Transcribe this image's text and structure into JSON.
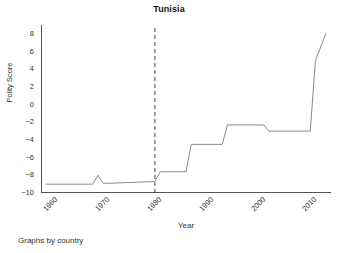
{
  "chart_data": {
    "type": "line",
    "title": "Tunisia",
    "xlabel": "Year",
    "ylabel": "Polity Score",
    "footnote": "Graphs by country",
    "xlim": [
      1958,
      2014
    ],
    "ylim": [
      -10,
      9
    ],
    "grid": false,
    "legend": null,
    "y_ticks": [
      8,
      6,
      4,
      2,
      0,
      -2,
      -4,
      -6,
      -8,
      -10
    ],
    "y_tick_labels": [
      "8",
      "6",
      "4",
      "2",
      "0",
      "−2",
      "−4",
      "−6",
      "−8",
      "−10"
    ],
    "x_ticks": [
      1960,
      1970,
      1980,
      1990,
      2000,
      2010
    ],
    "x_tick_labels": [
      "1960",
      "1970",
      "1980",
      "1990",
      "2000",
      "2010"
    ],
    "line_color": "#8a8a8a",
    "axis_color": "#555555",
    "reference_line": {
      "x": 1980,
      "style": "dashed",
      "color": "#444444",
      "label": ""
    },
    "series": [
      {
        "name": "Polity Score",
        "x": [
          1959,
          1968,
          1969,
          1970,
          1971,
          1980,
          1981,
          1986,
          1987,
          1993,
          1994,
          2001,
          2002,
          2010,
          2011,
          2013
        ],
        "values": [
          -9,
          -9,
          -8,
          -8.9,
          -8.9,
          -8.7,
          -7.6,
          -7.6,
          -4.5,
          -4.5,
          -2.3,
          -2.3,
          -3,
          -3,
          5,
          8
        ]
      }
    ]
  }
}
